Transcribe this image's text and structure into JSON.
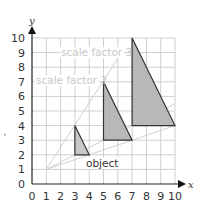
{
  "diagram": {
    "type": "enlargement-on-grid",
    "axes": {
      "x_label": "x",
      "y_label": "y",
      "x_ticks": [
        "0",
        "1",
        "2",
        "3",
        "4",
        "5",
        "6",
        "7",
        "8",
        "9",
        "10"
      ],
      "y_ticks": [
        "0",
        "1",
        "2",
        "3",
        "4",
        "5",
        "6",
        "7",
        "8",
        "9",
        "10"
      ],
      "range": [
        0,
        10
      ]
    },
    "centre_of_enlargement": [
      1,
      1
    ],
    "shapes": [
      {
        "name": "object",
        "label": "object",
        "vertices": [
          [
            3,
            2
          ],
          [
            3,
            4
          ],
          [
            4,
            2
          ]
        ],
        "fill": "#c8c8c8"
      },
      {
        "name": "image-scale-factor-2",
        "label": "scale factor 2",
        "vertices": [
          [
            5,
            3
          ],
          [
            5,
            7
          ],
          [
            7,
            3
          ]
        ],
        "fill": "#b8b8b8"
      },
      {
        "name": "image-scale-factor-3",
        "label": "scale factor 3",
        "vertices": [
          [
            7,
            4
          ],
          [
            7,
            10
          ],
          [
            10,
            4
          ]
        ],
        "fill": "#b8b8b8"
      }
    ],
    "rays": [
      {
        "from": [
          1,
          1
        ],
        "to": [
          6,
          8.6
        ]
      },
      {
        "from": [
          1,
          1
        ],
        "to": [
          10,
          4
        ]
      },
      {
        "from": [
          1,
          1
        ],
        "to": [
          10,
          5.5
        ]
      }
    ],
    "labels": {
      "object": "object",
      "scale_factor_2": "scale factor 2",
      "scale_factor_3": "scale factor 3"
    },
    "colors": {
      "grid": "#cfcfcf",
      "axis": "#222222",
      "ray": "#d0d0d0",
      "shape_stroke": "#333333",
      "annotation_faded": "#c8c8c8",
      "annotation_dark": "#333333"
    }
  }
}
